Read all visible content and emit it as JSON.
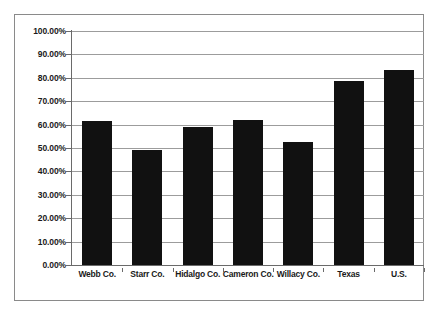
{
  "chart_data": {
    "type": "bar",
    "title": "",
    "xlabel": "",
    "ylabel": "",
    "categories": [
      "Webb Co.",
      "Starr Co.",
      "Hidalgo Co.",
      "Cameron Co.",
      "Willacy Co.",
      "Texas",
      "U.S."
    ],
    "values": [
      61.5,
      49.0,
      59.0,
      62.0,
      52.5,
      78.5,
      83.5
    ],
    "value_suffix": "%",
    "ylim": [
      0,
      100
    ],
    "ytick_values": [
      0,
      10,
      20,
      30,
      40,
      50,
      60,
      70,
      80,
      90,
      100
    ],
    "ytick_labels": [
      "0.00%",
      "10.00%",
      "20.00%",
      "30.00%",
      "40.00%",
      "50.00%",
      "60.00%",
      "70.00%",
      "80.00%",
      "90.00%",
      "100.00%"
    ],
    "grid": true,
    "legend": false,
    "legend_position": "none",
    "series": [
      {
        "name": "",
        "color": "#111111",
        "values": [
          61.5,
          49.0,
          59.0,
          62.0,
          52.5,
          78.5,
          83.5
        ]
      }
    ]
  },
  "style": {
    "bar_color": "#111111",
    "gridline_color": "#9c9c9c",
    "axis_color": "#6a6a6a",
    "border_color": "#8a8a8a",
    "plot_background": "#ffffff",
    "text_color": "#1a1a1a"
  }
}
